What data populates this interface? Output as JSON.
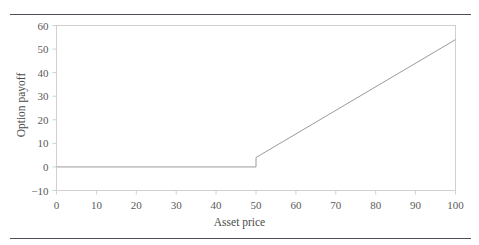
{
  "chart_data": {
    "type": "line",
    "title": "",
    "subtitle": "",
    "xlabel": "Asset price",
    "ylabel": "Option payoff",
    "xlim": [
      0,
      100
    ],
    "ylim": [
      -10,
      60
    ],
    "xticks": [
      0,
      10,
      20,
      30,
      40,
      50,
      60,
      70,
      80,
      90,
      100
    ],
    "yticks": [
      -10,
      0,
      10,
      20,
      30,
      40,
      50,
      60
    ],
    "xtick_labels": [
      "0",
      "10",
      "20",
      "30",
      "40",
      "50",
      "60",
      "70",
      "80",
      "90",
      "100"
    ],
    "ytick_labels": [
      "−10",
      "0",
      "10",
      "20",
      "30",
      "40",
      "50",
      "60"
    ],
    "grid": false,
    "legend": null,
    "legend_position": "none",
    "line_color": "#9a9a9a",
    "frame_color": "#d0d0d0",
    "strike": 50,
    "jump_at_strike": 4,
    "series": [
      {
        "name": "Option payoff",
        "x": [
          0,
          50,
          50,
          100
        ],
        "values": [
          0,
          0,
          4,
          54
        ]
      }
    ],
    "annotations": []
  },
  "decorations": {
    "top_rule_color": "#4f4f57",
    "bottom_rule_color": "#4f4f57"
  }
}
